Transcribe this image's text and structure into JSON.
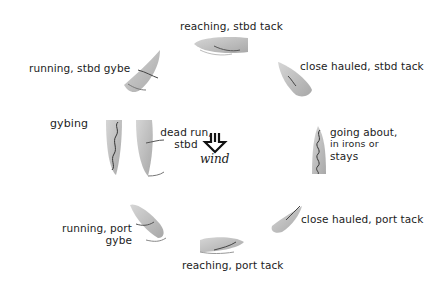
{
  "diagram": {
    "boat_color": "#c4c4c4",
    "boat_shade": "#a9a9a9",
    "line_color": "#3a3a3a",
    "wind": {
      "label": "wind",
      "icon": "down-arrow-icon"
    },
    "positions": [
      {
        "id": "reaching-stbd",
        "label": "reaching, stbd tack"
      },
      {
        "id": "close-hauled-stbd",
        "label": "close hauled, stbd tack"
      },
      {
        "id": "going-about",
        "label_lines": [
          "going about,",
          "in irons or",
          "stays"
        ]
      },
      {
        "id": "close-hauled-port",
        "label": "close hauled, port tack"
      },
      {
        "id": "reaching-port",
        "label": "reaching, port tack"
      },
      {
        "id": "running-port",
        "label_lines": [
          "running, port",
          "gybe"
        ]
      },
      {
        "id": "gybing",
        "label": "gybing"
      },
      {
        "id": "dead-run-stbd",
        "label_lines": [
          "dead run,",
          "stbd"
        ]
      },
      {
        "id": "running-stbd",
        "label": "running, stbd gybe"
      }
    ]
  }
}
